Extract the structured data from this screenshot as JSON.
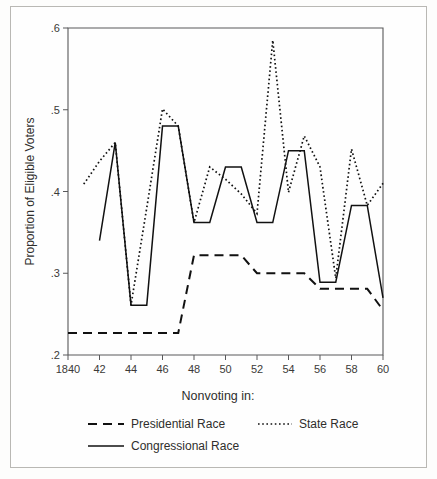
{
  "figure": {
    "background_color": "#fefefe",
    "frame_color": "#b9b8b4",
    "line_color": "#111111"
  },
  "axis": {
    "y_title": "Proportion of Eligible Voters",
    "y_ticks": [
      ".2",
      ".3",
      ".4",
      ".5",
      ".6"
    ],
    "y_tick_values": [
      0.2,
      0.3,
      0.4,
      0.5,
      0.6
    ],
    "x_ticks": [
      "1840",
      "42",
      "44",
      "46",
      "48",
      "50",
      "52",
      "54",
      "56",
      "58",
      "60"
    ],
    "x_tick_values": [
      1840,
      1842,
      1844,
      1846,
      1848,
      1850,
      1852,
      1854,
      1856,
      1858,
      1860
    ]
  },
  "legend": {
    "title": "Nonvoting in:",
    "entries": [
      {
        "label": "Presidential Race",
        "style": "dashed"
      },
      {
        "label": "State Race",
        "style": "dotted"
      },
      {
        "label": "Congressional Race",
        "style": "solid"
      }
    ]
  },
  "chart_data": {
    "type": "line",
    "title": "",
    "subtitle": "",
    "xlabel": "",
    "ylabel": "Proportion of Eligible Voters",
    "xlim": [
      1840,
      1860
    ],
    "ylim": [
      0.2,
      0.6
    ],
    "grid": false,
    "legend_position": "bottom",
    "legend_title": "Nonvoting in:",
    "x": [
      1840,
      1841,
      1842,
      1843,
      1844,
      1845,
      1846,
      1847,
      1848,
      1849,
      1850,
      1851,
      1852,
      1853,
      1854,
      1855,
      1856,
      1857,
      1858,
      1859,
      1860
    ],
    "series": [
      {
        "name": "Presidential Race",
        "style": "dashed",
        "x": [
          1840,
          1841,
          1842,
          1843,
          1844,
          1845,
          1846,
          1847,
          1848,
          1849,
          1850,
          1851,
          1852,
          1853,
          1854,
          1855,
          1856,
          1857,
          1858,
          1859,
          1860
        ],
        "values": [
          0.227,
          0.227,
          0.227,
          0.227,
          0.227,
          0.227,
          0.227,
          0.227,
          0.322,
          0.322,
          0.322,
          0.322,
          0.3,
          0.3,
          0.3,
          0.3,
          0.281,
          0.281,
          0.281,
          0.281,
          0.255
        ]
      },
      {
        "name": "State Race",
        "style": "dotted",
        "x": [
          1841,
          1842,
          1843,
          1844,
          1845,
          1846,
          1847,
          1848,
          1849,
          1850,
          1851,
          1852,
          1853,
          1854,
          1855,
          1856,
          1857,
          1858,
          1859,
          1860
        ],
        "values": [
          0.409,
          0.437,
          0.46,
          0.261,
          0.38,
          0.501,
          0.48,
          0.362,
          0.43,
          0.415,
          0.397,
          0.373,
          0.585,
          0.399,
          0.468,
          0.43,
          0.294,
          0.452,
          0.383,
          0.41
        ]
      },
      {
        "name": "Congressional Race",
        "style": "solid",
        "x": [
          1842,
          1843,
          1844,
          1845,
          1846,
          1847,
          1848,
          1849,
          1850,
          1851,
          1852,
          1853,
          1854,
          1855,
          1856,
          1857,
          1858,
          1859,
          1860
        ],
        "values": [
          0.34,
          0.46,
          0.261,
          0.261,
          0.48,
          0.48,
          0.362,
          0.362,
          0.43,
          0.43,
          0.362,
          0.362,
          0.45,
          0.45,
          0.289,
          0.289,
          0.383,
          0.383,
          0.27
        ]
      }
    ],
    "extra_points": {
      "state_race_right_tail": 0.255
    }
  }
}
